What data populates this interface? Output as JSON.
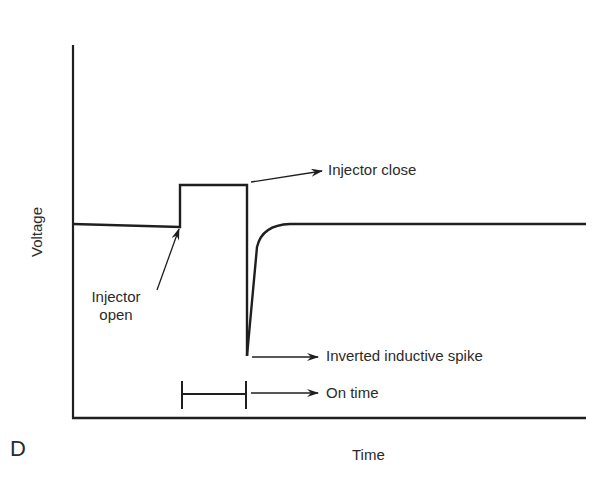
{
  "diagram": {
    "panel_letter": "D",
    "axes": {
      "y_label": "Voltage",
      "x_label": "Time"
    },
    "annotations": {
      "injector_open": [
        "Injector",
        "open"
      ],
      "injector_close": "Injector close",
      "spike": "Inverted inductive spike",
      "on_time": "On time"
    },
    "colors": {
      "line": "#1f1f1f",
      "background": "#ffffff",
      "text": "#2b2b2b"
    }
  }
}
